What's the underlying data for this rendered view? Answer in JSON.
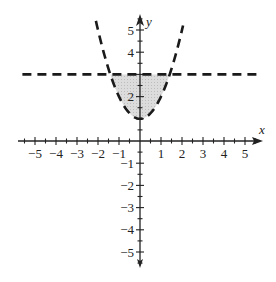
{
  "chart_data": {
    "type": "line",
    "title": "",
    "xlabel": "x",
    "ylabel": "y",
    "xlim": [
      -5.5,
      5.5
    ],
    "ylim": [
      -5.5,
      5.5
    ],
    "x_ticks": [
      -5,
      -4,
      -3,
      -2,
      -1,
      1,
      2,
      3,
      4,
      5
    ],
    "y_ticks": [
      -5,
      -4,
      -3,
      -2,
      -1,
      2,
      4,
      5
    ],
    "x_tick_labels": [
      "−5",
      "−4",
      "−3",
      "−2",
      "−1",
      "1",
      "2",
      "3",
      "4",
      "5"
    ],
    "y_tick_labels": {
      "5": "5",
      "4": "4",
      "2": "2",
      "-1": "−1",
      "-2": "−2",
      "-3": "−3",
      "-4": "−4",
      "-5": "−5"
    },
    "minor_ticks_every": 0.5,
    "grid": false,
    "series": [
      {
        "name": "parabola",
        "equation": "y = x^2 + 1",
        "style": "dashed",
        "color": "#1a1a1a",
        "x_range": [
          -2.1,
          2.05
        ],
        "vertex": [
          0,
          1
        ]
      },
      {
        "name": "horizontal line",
        "equation": "y = 3",
        "style": "dashed",
        "color": "#1a1a1a",
        "x_range": [
          -5.6,
          5.6
        ]
      }
    ],
    "shaded_region": {
      "description": "region between y = x^2 + 1 and y = 3",
      "x_range": [
        -1.414,
        1.414
      ],
      "fill": "#d6d6d6"
    }
  },
  "labels": {
    "x_axis": "x",
    "y_axis": "y"
  }
}
